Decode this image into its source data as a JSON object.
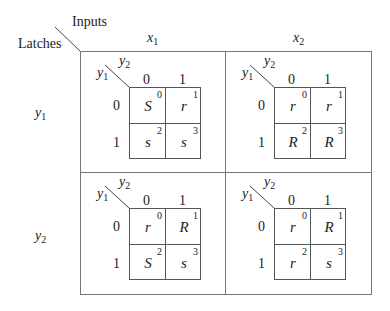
{
  "header": {
    "inputs_label": "Inputs",
    "latches_label": "Latches",
    "col_labels": [
      {
        "var": "x",
        "sub": "1"
      },
      {
        "var": "x",
        "sub": "2"
      }
    ],
    "row_labels": [
      {
        "var": "y",
        "sub": "1"
      },
      {
        "var": "y",
        "sub": "2"
      }
    ]
  },
  "kmap_axes": {
    "row_var": {
      "var": "y",
      "sub": "1"
    },
    "col_var": {
      "var": "y",
      "sub": "2"
    },
    "col_values": [
      "0",
      "1"
    ],
    "row_values": [
      "0",
      "1"
    ]
  },
  "maps": [
    {
      "name": "y1-x1",
      "cells": [
        {
          "v": "S",
          "n": "0"
        },
        {
          "v": "r",
          "n": "1"
        },
        {
          "v": "s",
          "n": "2"
        },
        {
          "v": "s",
          "n": "3"
        }
      ]
    },
    {
      "name": "y1-x2",
      "cells": [
        {
          "v": "r",
          "n": "0"
        },
        {
          "v": "r",
          "n": "1"
        },
        {
          "v": "R",
          "n": "2"
        },
        {
          "v": "R",
          "n": "3"
        }
      ]
    },
    {
      "name": "y2-x1",
      "cells": [
        {
          "v": "r",
          "n": "0"
        },
        {
          "v": "R",
          "n": "1"
        },
        {
          "v": "S",
          "n": "2"
        },
        {
          "v": "s",
          "n": "3"
        }
      ]
    },
    {
      "name": "y2-x2",
      "cells": [
        {
          "v": "r",
          "n": "0"
        },
        {
          "v": "R",
          "n": "1"
        },
        {
          "v": "r",
          "n": "2"
        },
        {
          "v": "s",
          "n": "3"
        }
      ]
    }
  ]
}
